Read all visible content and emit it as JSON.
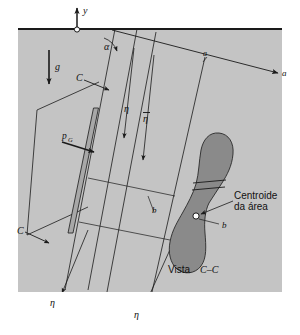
{
  "figure": {
    "language": "pt-BR",
    "colors": {
      "page_background": "#ffffff",
      "fluid_fill": "#c4c4c4",
      "surface_line": "#1a1a1a",
      "plate_fill": "#a8a8a8",
      "area_fill": "#8a8a8a",
      "line": "#1a1a1a",
      "text": "#111111"
    },
    "labels": {
      "y_axis": "y",
      "gravity": "g",
      "alpha_angle": "α",
      "a_axis_tick": "a",
      "a_axis_arrow": "a",
      "section_c_top": "C",
      "section_c_bottom": "C",
      "pressure_at_centroid": "p",
      "pressure_at_centroid_sub": "G",
      "eta_left": "η",
      "eta_bar": "η",
      "eta_bottom_left": "η",
      "eta_bottom_right": "η",
      "b_left": "b",
      "b_right": "b",
      "centroid_line1": "Centroide",
      "centroid_line2": "da área",
      "view_label_prefix": "Vista",
      "view_label_section": "C–C"
    },
    "annotation_list": [
      "y",
      "g",
      "α",
      "a",
      "a",
      "C",
      "C",
      "pG",
      "η",
      "η̄",
      "η",
      "η",
      "b",
      "b",
      "Centroide da área",
      "Vista C–C"
    ]
  }
}
